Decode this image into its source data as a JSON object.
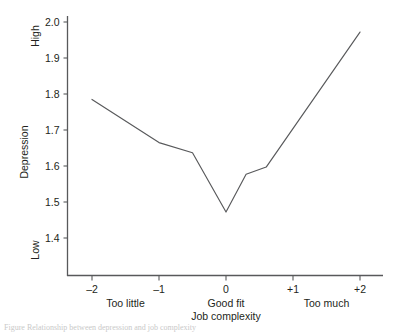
{
  "chart_data": {
    "type": "line",
    "title": "",
    "xlabel": "Job complexity",
    "ylabel": "Depression",
    "x_tick_labels": [
      "–2",
      "–1",
      "0",
      "+1",
      "+2"
    ],
    "x_tick_values": [
      -2,
      -1,
      0,
      1,
      2
    ],
    "x_category_labels": [
      "Too little",
      "Good fit",
      "Too much"
    ],
    "x_category_positions": [
      -1.5,
      0,
      1.5
    ],
    "y_tick_labels": [
      "2.0",
      "1.9",
      "1.8",
      "1.7",
      "1.6",
      "1.5",
      "1.4"
    ],
    "y_tick_values": [
      2.0,
      1.9,
      1.8,
      1.7,
      1.6,
      1.5,
      1.4
    ],
    "y_high_label": "High",
    "y_low_label": "Low",
    "ylim": [
      1.355,
      2.045
    ],
    "xlim": [
      -2.45,
      2.45
    ],
    "grid": false,
    "legend": "none",
    "line_color": "#58595b",
    "axis_color": "#58595b",
    "series": [
      {
        "name": "Depression",
        "x": [
          -2.0,
          -1.0,
          -0.5,
          0.0,
          0.3,
          0.6,
          2.0
        ],
        "values": [
          1.785,
          1.665,
          1.637,
          1.472,
          1.577,
          1.597,
          1.972
        ]
      }
    ]
  },
  "caption": {
    "text": "Figure  Relationship between depression and job complexity"
  }
}
